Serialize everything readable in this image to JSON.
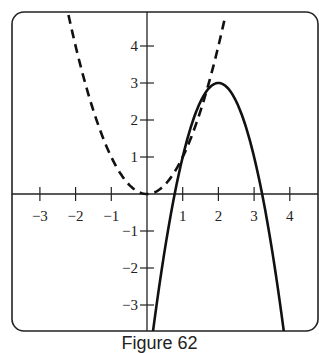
{
  "caption": "Figure 62",
  "colors": {
    "ink": "#222222",
    "background": "#ffffff"
  },
  "chart_data": {
    "type": "line",
    "title": "",
    "caption": "Figure 62",
    "xlabel": "",
    "ylabel": "",
    "xlim": [
      -3.8,
      4.8
    ],
    "ylim": [
      -3.72,
      4.92
    ],
    "grid": false,
    "legend": null,
    "x_ticks": [
      -3,
      -2,
      -1,
      1,
      2,
      3,
      4
    ],
    "x_tick_labels": [
      "−3",
      "−2",
      "−1",
      "1",
      "2",
      "3",
      "4"
    ],
    "y_ticks": [
      -3,
      -2,
      -1,
      1,
      2,
      3,
      4
    ],
    "y_tick_labels": [
      "−3",
      "−2",
      "−1",
      "1",
      "2",
      "3",
      "4"
    ],
    "series": [
      {
        "name": "dashed parabola",
        "style": "dashed",
        "equation": "y = x^2",
        "x": [
          -2.2,
          -2,
          -1.5,
          -1,
          -0.5,
          0,
          0.5,
          1,
          1.5,
          2,
          2.2
        ],
        "y": [
          4.84,
          4,
          2.25,
          1,
          0.25,
          0,
          0.25,
          1,
          2.25,
          4,
          4.84
        ]
      },
      {
        "name": "solid parabola",
        "style": "solid",
        "equation": "y = 3 - 2(x - 2)^2",
        "x": [
          0.15,
          0.5,
          0.78,
          1,
          1.5,
          2,
          2.5,
          3,
          3.22,
          3.5,
          3.85
        ],
        "y": [
          -3.85,
          -1.5,
          0,
          1,
          2.5,
          3,
          2.5,
          1,
          0,
          -1.5,
          -3.85
        ]
      }
    ],
    "annotations": []
  }
}
